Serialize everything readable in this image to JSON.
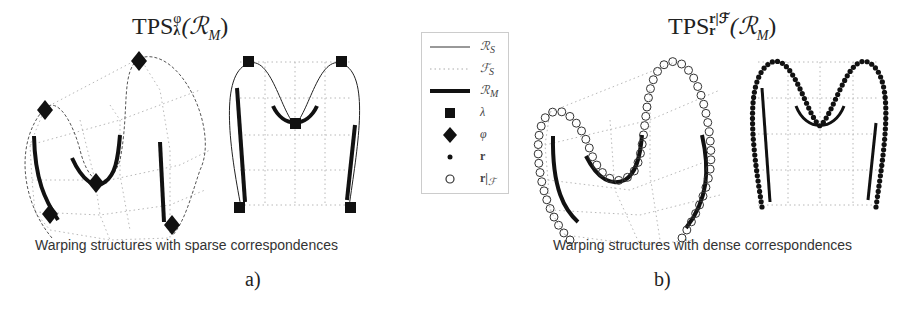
{
  "panel_a": {
    "title": {
      "base": "TPS",
      "sup": "φ",
      "sub": "λ",
      "arg": "(ℛ",
      "arg_sub": "M",
      "close": ")"
    },
    "caption": "Warping structures with sparse correspondences",
    "label": "a)"
  },
  "panel_b": {
    "title": {
      "base": "TPS",
      "sup": "r|ℱ",
      "sub": "r",
      "arg": "(ℛ",
      "arg_sub": "M",
      "close": ")"
    },
    "caption": "Warping structures with dense correspondences",
    "label": "b)"
  },
  "legend": {
    "items": [
      {
        "symbol": "thin-solid-line",
        "label": "ℛ",
        "sub": "S"
      },
      {
        "symbol": "dotted-line",
        "label": "ℱ",
        "sub": "S"
      },
      {
        "symbol": "thick-solid-line",
        "label": "ℛ",
        "sub": "M"
      },
      {
        "symbol": "filled-square",
        "label": "λ",
        "sub": ""
      },
      {
        "symbol": "filled-diamond",
        "label": "φ",
        "sub": ""
      },
      {
        "symbol": "small-dot",
        "label": "r",
        "sub": ""
      },
      {
        "symbol": "open-circle",
        "label": "r|",
        "sub": "ℱ"
      }
    ]
  },
  "colors": {
    "ink": "#111111",
    "grid": "#b8b8b8",
    "text": "#333333"
  }
}
